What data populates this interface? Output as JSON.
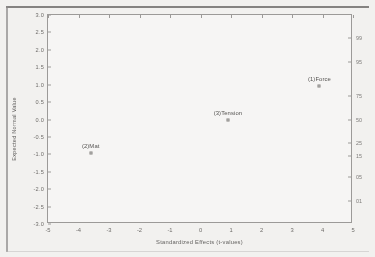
{
  "chart_data": {
    "type": "scatter",
    "title": "",
    "xlabel": "Standardized Effects (t-values)",
    "ylabel": "Expected Normal Value",
    "right_axis_label": "",
    "xlim": [
      -5,
      5
    ],
    "ylim": [
      -3.0,
      3.0
    ],
    "grid": false,
    "legend": "none",
    "xticks": [
      "-5",
      "-4",
      "-3",
      "-2",
      "-1",
      "0",
      "1",
      "2",
      "3",
      "4",
      "5"
    ],
    "xtick_values": [
      -5,
      -4,
      -3,
      -2,
      -1,
      0,
      1,
      2,
      3,
      4,
      5
    ],
    "yticks": [
      "3.0",
      "2.5",
      "2.0",
      "1.5",
      "1.0",
      "0.5",
      "0.0",
      "-0.5",
      "-1.0",
      "-1.5",
      "-2.0",
      "-2.5",
      "-3.0"
    ],
    "ytick_values": [
      3.0,
      2.5,
      2.0,
      1.5,
      1.0,
      0.5,
      0.0,
      -0.5,
      -1.0,
      -1.5,
      -2.0,
      -2.5,
      -3.0
    ],
    "right_ticks": [
      "99",
      "95",
      "75",
      "50",
      "25",
      "15",
      "05",
      "01"
    ],
    "right_tick_positions": [
      2.33,
      1.64,
      0.67,
      0.0,
      -0.67,
      -1.04,
      -1.64,
      -2.33
    ],
    "points": [
      {
        "label": "(1)Force",
        "x": 3.9,
        "y": 0.97
      },
      {
        "label": "(3)Tension",
        "x": 0.9,
        "y": 0.0
      },
      {
        "label": "(2)Mat",
        "x": -3.6,
        "y": -0.97
      }
    ],
    "series": [
      {
        "name": "Standardized Effects",
        "x": [
          3.9,
          0.9,
          -3.6
        ],
        "values": [
          0.97,
          0.0,
          -0.97
        ],
        "labels": [
          "(1)Force",
          "(3)Tension",
          "(2)Mat"
        ]
      }
    ],
    "colors": {
      "axis": "#9b9997",
      "text": "#5d5b59",
      "marker_fill": "#dedcda",
      "marker_edge": "#8d8b89",
      "plot_background": "#fbfaf9",
      "page_background": "#f2f1ef"
    }
  }
}
